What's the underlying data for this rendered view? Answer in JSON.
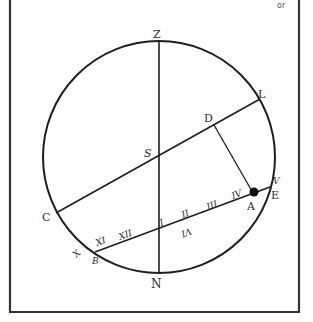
{
  "figure": {
    "corner_text": "or",
    "ink_color": "#1e1e1e",
    "frame_color": "#333333",
    "dot_color": "#111111"
  },
  "labels": {
    "Z": "Z",
    "N": "N",
    "L": "L",
    "C": "C",
    "S": "S",
    "D": "D",
    "A": "A",
    "E": "E",
    "V": "V",
    "B": "B",
    "X": "X",
    "XI": "XI",
    "XII": "XII",
    "I": "I",
    "II": "II",
    "III": "III",
    "IV": "IV",
    "VI": "VI"
  }
}
